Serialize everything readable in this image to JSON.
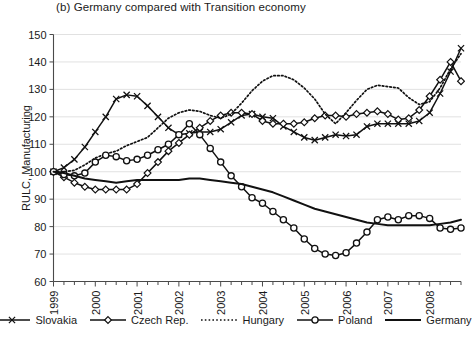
{
  "chart_data": {
    "type": "line",
    "title": "(b) Germany compared with Transition economy",
    "xlabel": "",
    "ylabel": "RULC, Manufacturing",
    "ylim": [
      60,
      150
    ],
    "yticks": [
      60,
      70,
      80,
      90,
      100,
      110,
      120,
      130,
      140,
      150
    ],
    "grid": true,
    "legend_position": "bottom",
    "xtick_labels": [
      "1999",
      "2000",
      "2001",
      "2002",
      "2003",
      "2004",
      "2005",
      "2006",
      "2007",
      "2008"
    ],
    "x_unit": "quarter",
    "x_start": "1999Q1",
    "x_end": "2008Q4",
    "x_points": 40,
    "series": [
      {
        "name": "Slovakia",
        "marker": "x",
        "style": "solid",
        "values": [
          100,
          101.5,
          104.5,
          109,
          114.5,
          120,
          126.5,
          128,
          127.5,
          124,
          120,
          116,
          113.5,
          114,
          114.5,
          114.5,
          115.5,
          118,
          120.5,
          121,
          120,
          119.5,
          116.5,
          114.5,
          112.5,
          111.5,
          112.5,
          113.5,
          113,
          113.5,
          116.5,
          117.5,
          117.5,
          117.5,
          117.5,
          118.5,
          121.5,
          128.5,
          136.5,
          145
        ]
      },
      {
        "name": "Czech Rep.",
        "marker": "diamond",
        "style": "solid",
        "values": [
          100,
          98,
          96,
          94.5,
          93.5,
          93.5,
          93.5,
          93.5,
          95.5,
          99.5,
          103.5,
          107.5,
          110.5,
          113.5,
          116,
          118.5,
          120.5,
          121.5,
          121.5,
          121,
          118.5,
          117.5,
          117.5,
          117.5,
          118,
          119.5,
          120.5,
          120.5,
          120,
          121,
          121.5,
          122,
          121,
          119,
          119.5,
          122.5,
          127.5,
          133.5,
          140,
          133
        ]
      },
      {
        "name": "Hungary",
        "marker": "none",
        "style": "dotted",
        "values": [
          100,
          100,
          100.5,
          102.5,
          105,
          106.5,
          107.5,
          109.5,
          111,
          112.5,
          116,
          119.5,
          121.5,
          122.5,
          122,
          120.5,
          119.5,
          121,
          125,
          129.5,
          133,
          135,
          135,
          133.5,
          130.5,
          126.5,
          121,
          117.5,
          121.5,
          126,
          130,
          131.5,
          131,
          130.5,
          127,
          124.5,
          125.5,
          130.5,
          137.5,
          143
        ]
      },
      {
        "name": "Poland",
        "marker": "circle",
        "style": "solid",
        "values": [
          100,
          99,
          98.5,
          99.5,
          103.5,
          106,
          105.5,
          104,
          104.5,
          106,
          108,
          110,
          113.5,
          117.5,
          113.5,
          108.5,
          103.5,
          98.5,
          94.5,
          90.5,
          88.5,
          85.5,
          82.5,
          79.5,
          75.5,
          72,
          70,
          69.5,
          70.5,
          74,
          78,
          82.5,
          83.5,
          82.5,
          84,
          84,
          83,
          79.5,
          79,
          79.5
        ]
      },
      {
        "name": "Germany",
        "marker": "none",
        "style": "solid-plain",
        "values": [
          100,
          99.5,
          98.5,
          97.5,
          97,
          96.5,
          96,
          96.5,
          97,
          97,
          97,
          97,
          97,
          97.5,
          97.5,
          97,
          96.5,
          96,
          95.5,
          94.5,
          93.5,
          92.5,
          91,
          89.5,
          88,
          86.5,
          85.5,
          84.5,
          83.5,
          82.5,
          81.5,
          81,
          80.5,
          80.5,
          80.5,
          80.5,
          80.5,
          81,
          81.5,
          82.5
        ]
      }
    ]
  },
  "legend": {
    "items": [
      {
        "label": "Slovakia"
      },
      {
        "label": "Czech Rep."
      },
      {
        "label": "Hungary"
      },
      {
        "label": "Poland"
      },
      {
        "label": "Germany"
      }
    ]
  }
}
